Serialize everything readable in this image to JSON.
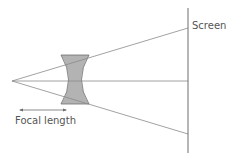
{
  "diagram": {
    "labels": {
      "screen": "Screen",
      "focal_length": "Focal length"
    },
    "colors": {
      "line": "#8a8a8a",
      "lens_fill": "#b3b3b3",
      "lens_stroke": "#6e6e6e",
      "text": "#555555"
    }
  }
}
